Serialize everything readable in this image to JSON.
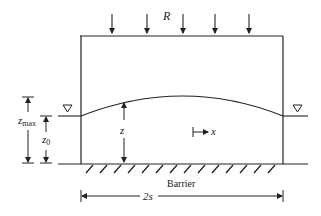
{
  "diagram": {
    "labels": {
      "recharge": "R",
      "z_max_main": "z",
      "z_max_sub": "max",
      "z0_main": "z",
      "z0_sub": "0",
      "z": "z",
      "x": "x",
      "barrier": "Barrier",
      "width": "2s"
    },
    "colors": {
      "line": "#222222",
      "background": "#ffffff"
    },
    "recharge_arrow_count": 5
  }
}
